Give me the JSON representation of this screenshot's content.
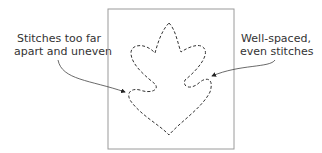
{
  "diagram": {
    "labels": {
      "left": [
        "Stitches too far",
        "apart and uneven"
      ],
      "right": [
        "Well-spaced,",
        "even stitches"
      ]
    },
    "colors": {
      "frame": "#9a9a9a",
      "stitch": "#333333",
      "text": "#333333"
    }
  }
}
